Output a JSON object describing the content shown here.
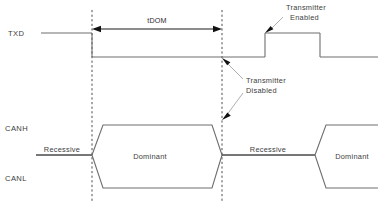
{
  "diagram": {
    "type": "timing-diagram",
    "background_color": "#ffffff",
    "wave_color": "#6e6e6e",
    "wave_color_dark": "#4a4a4a",
    "marker_color": "#3a3a3a",
    "annotation_color": "#1a1a1a",
    "text_color": "#3d3d3d"
  },
  "signals": [
    {
      "id": "txd",
      "label": "TXD"
    },
    {
      "id": "canh",
      "label": "CANH"
    },
    {
      "id": "canl",
      "label": "CANL"
    }
  ],
  "bus_states": [
    {
      "id": "recessive-1",
      "label": "Recessive"
    },
    {
      "id": "dominant-1",
      "label": "Dominant"
    },
    {
      "id": "recessive-2",
      "label": "Recessive"
    },
    {
      "id": "dominant-2",
      "label": "Dominant"
    }
  ],
  "annotations": {
    "dimension": {
      "label": "tDOM",
      "start_x": 92,
      "end_x": 222
    },
    "transmitter_enabled": {
      "line1": "Transmitter",
      "line2": "Enabled"
    },
    "transmitter_disabled": {
      "line1": "Transmitter",
      "line2": "Disabled"
    }
  },
  "markers": [
    {
      "id": "marker-start",
      "x": 92
    },
    {
      "id": "marker-end",
      "x": 222
    }
  ],
  "waveforms": {
    "txd": {
      "high_y": 33,
      "low_y": 57,
      "edges": [
        {
          "x": 92,
          "direction": "fall"
        },
        {
          "x": 265,
          "direction": "rise"
        },
        {
          "x": 320,
          "direction": "fall"
        }
      ]
    },
    "can": {
      "recessive_y": 155,
      "canh_dominant_y": 125,
      "canl_dominant_y": 188
    }
  }
}
